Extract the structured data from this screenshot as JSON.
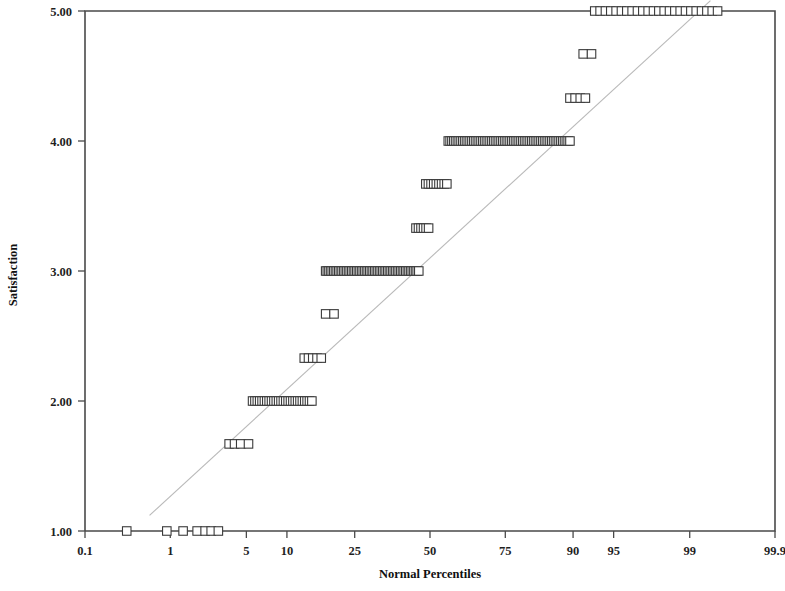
{
  "chart_data": {
    "type": "scatter",
    "title": "",
    "subtitle": "",
    "xlabel": "Normal Percentiles",
    "ylabel": "Satisfaction",
    "grid": false,
    "legend": "none",
    "x_scale": "normal-probability",
    "x_tick_labels": [
      "0.1",
      "1",
      "5",
      "10",
      "25",
      "50",
      "75",
      "90",
      "95",
      "99",
      "99.9"
    ],
    "x_tick_values": [
      0.1,
      1,
      5,
      10,
      25,
      50,
      75,
      90,
      95,
      99,
      99.9
    ],
    "xlim": [
      0.1,
      99.9
    ],
    "y_tick_labels": [
      "1.00",
      "2.00",
      "3.00",
      "4.00",
      "5.00"
    ],
    "y_tick_values": [
      1.0,
      2.0,
      3.0,
      4.0,
      5.0
    ],
    "ylim": [
      1.0,
      5.0
    ],
    "reference_line": {
      "label": "normal reference line",
      "x_percentiles": [
        0.6,
        99.4
      ],
      "y_values": [
        1.12,
        5.08
      ]
    },
    "series": [
      {
        "name": "Satisfaction observations",
        "marker": "open-square",
        "levels": [
          {
            "y": 1.0,
            "percentile_start": 0.33,
            "percentile_end": 2.9,
            "count": 7,
            "percentiles": [
              0.33,
              0.92,
              1.35,
              1.85,
              2.2,
              2.5,
              2.9
            ]
          },
          {
            "y": 1.67,
            "percentile_start": 3.6,
            "percentile_end": 5.2,
            "count": 4,
            "percentiles": [
              3.6,
              4.0,
              4.5,
              5.2
            ]
          },
          {
            "y": 2.0,
            "percentile_start": 5.6,
            "percentile_end": 14.5,
            "count": 26
          },
          {
            "y": 2.33,
            "percentile_start": 13.0,
            "percentile_end": 16.5,
            "count": 5
          },
          {
            "y": 2.67,
            "percentile_start": 17.5,
            "percentile_end": 19.5,
            "count": 2
          },
          {
            "y": 3.0,
            "percentile_start": 17.5,
            "percentile_end": 46.0,
            "count": 58
          },
          {
            "y": 3.33,
            "percentile_start": 45.0,
            "percentile_end": 49.5,
            "count": 6
          },
          {
            "y": 3.67,
            "percentile_start": 48.5,
            "percentile_end": 56.0,
            "count": 9
          },
          {
            "y": 4.0,
            "percentile_start": 56.5,
            "percentile_end": 89.5,
            "count": 68
          },
          {
            "y": 4.33,
            "percentile_start": 89.5,
            "percentile_end": 91.8,
            "count": 4
          },
          {
            "y": 4.67,
            "percentile_start": 91.5,
            "percentile_end": 92.6,
            "count": 2
          },
          {
            "y": 5.0,
            "percentile_start": 93.0,
            "percentile_end": 99.5,
            "count": 24
          }
        ]
      }
    ]
  },
  "axes": {
    "x_title": "Normal Percentiles",
    "y_title": "Satisfaction",
    "x_ticks": [
      "0.1",
      "1",
      "5",
      "10",
      "25",
      "50",
      "75",
      "90",
      "95",
      "99",
      "99.9"
    ],
    "y_ticks": [
      "1.00",
      "2.00",
      "3.00",
      "4.00",
      "5.00"
    ]
  }
}
